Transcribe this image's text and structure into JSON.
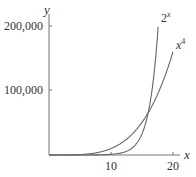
{
  "chart_data": {
    "type": "line",
    "title": "",
    "xlabel": "x",
    "ylabel": "y",
    "xlim": [
      0,
      21
    ],
    "ylim": [
      0,
      200000
    ],
    "x_ticks": [
      10,
      20
    ],
    "x_tick_labels": [
      "10",
      "20"
    ],
    "y_ticks": [
      100000,
      200000
    ],
    "y_tick_labels": [
      "100,000",
      "200,000"
    ],
    "grid": false,
    "series": [
      {
        "name": "2^x",
        "label": "2",
        "label_sup": "x",
        "function": "2^x",
        "x_range": [
          0,
          17.6
        ],
        "color": "#666666"
      },
      {
        "name": "x^4",
        "label": "x",
        "label_sup": "4",
        "function": "x^4",
        "x_range": [
          0,
          20
        ],
        "color": "#666666"
      }
    ],
    "intersection_approx": {
      "x": 16,
      "y": 65536
    }
  }
}
